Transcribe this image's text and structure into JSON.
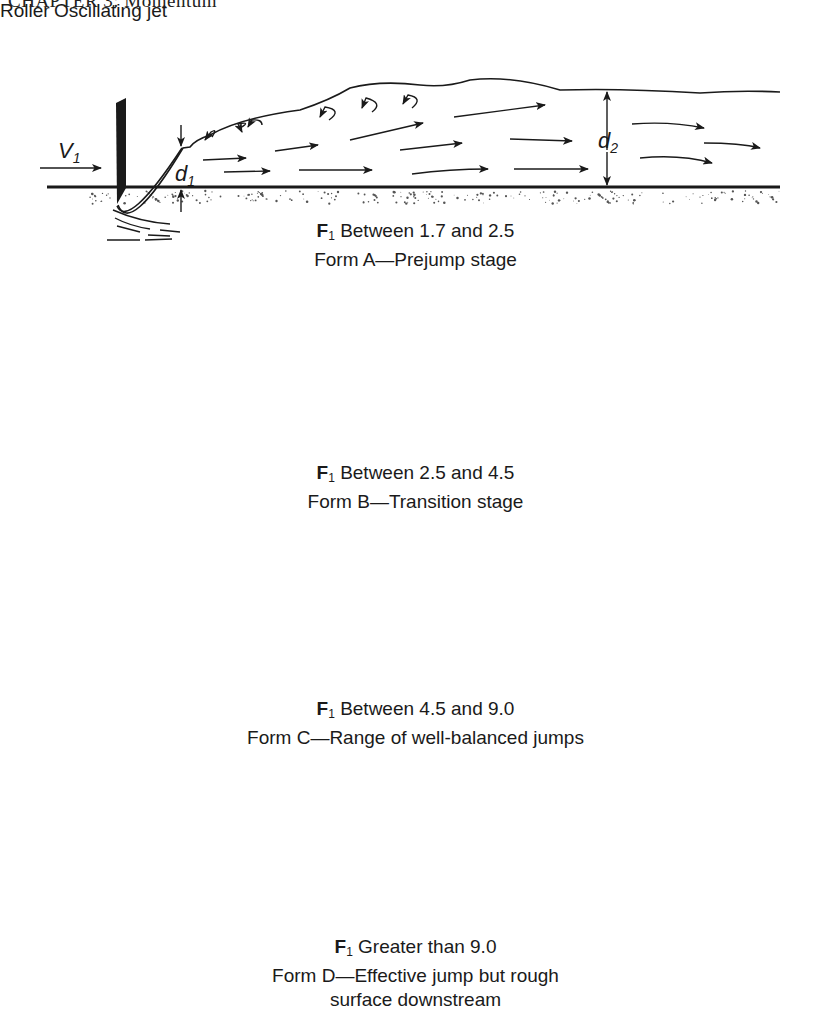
{
  "header": {
    "text": "CHAPTER 3: Momentum",
    "note": "partially cut off at top edge"
  },
  "panels": [
    {
      "id": "A",
      "froude_label": "F",
      "froude_sub": "1",
      "froude_range": "Between 1.7 and 2.5",
      "form": "Form A—Prejump stage",
      "labels": {
        "v1": "V",
        "v1_sub": "1",
        "d1": "d",
        "d1_sub": "1",
        "d2": "d",
        "d2_sub": "2"
      }
    },
    {
      "id": "B",
      "froude_label": "F",
      "froude_sub": "1",
      "froude_range": "Between 2.5 and 4.5",
      "form": "Form B—Transition stage",
      "labels": {
        "roller": "Roller",
        "oscillating_jet": "Oscillating jet"
      }
    },
    {
      "id": "C",
      "froude_label": "F",
      "froude_sub": "1",
      "froude_range": "Between 4.5 and 9.0",
      "form": "Form C—Range of well-balanced jumps"
    },
    {
      "id": "D",
      "froude_label": "F",
      "froude_sub": "1",
      "froude_range": "Greater than 9.0",
      "form_line1": "Form D—Effective jump but rough",
      "form_line2": "surface downstream"
    }
  ],
  "colors": {
    "ink": "#1a1a1a",
    "background": "#ffffff",
    "stipple": "#555555"
  }
}
